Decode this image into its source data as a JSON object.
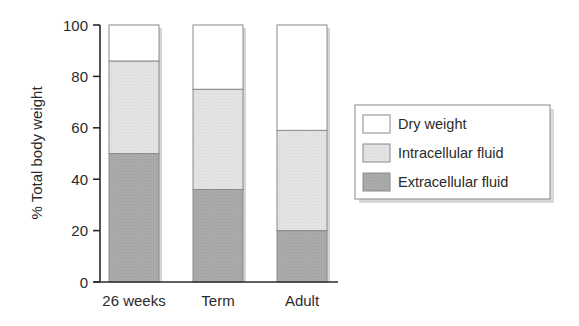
{
  "chart_data": {
    "type": "bar",
    "stacked": true,
    "title": "",
    "xlabel": "",
    "ylabel": "% Total body weight",
    "ylim": [
      0,
      100
    ],
    "yticks": [
      0,
      20,
      40,
      60,
      80,
      100
    ],
    "categories": [
      "26 weeks",
      "Term",
      "Adult"
    ],
    "series": [
      {
        "name": "Extracellular fluid",
        "color": "#a9a9a9",
        "values": [
          50,
          36,
          20
        ]
      },
      {
        "name": "Intracellular fluid",
        "color": "#e2e2e2",
        "values": [
          36,
          39,
          39
        ]
      },
      {
        "name": "Dry weight",
        "color": "#ffffff",
        "values": [
          14,
          25,
          41
        ]
      }
    ],
    "legend": {
      "position": "right",
      "entries": [
        "Dry weight",
        "Intracellular fluid",
        "Extracellular fluid"
      ]
    },
    "grid": false
  }
}
